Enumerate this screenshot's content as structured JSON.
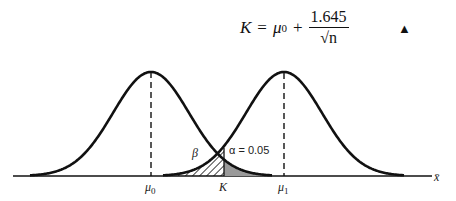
{
  "formula": {
    "lhs": "K",
    "equals": "=",
    "mu": "μ",
    "mu_sub": "0",
    "plus": "+",
    "numerator": "1.645",
    "denominator": "√n",
    "end_marker": "▲"
  },
  "diagram": {
    "x_axis_label": "x̄",
    "labels": {
      "mu0": "μ0",
      "mu1": "μ1",
      "K": "K",
      "beta": "β",
      "alpha": "α = 0.05"
    },
    "curves": [
      {
        "name": "null-distribution",
        "mean_label": "μ0"
      },
      {
        "name": "alternative-distribution",
        "mean_label": "μ1"
      }
    ],
    "regions": [
      {
        "name": "beta-region",
        "fill": "hatched",
        "label": "β"
      },
      {
        "name": "alpha-region",
        "fill": "#9a9a9a",
        "label": "α = 0.05"
      }
    ]
  }
}
